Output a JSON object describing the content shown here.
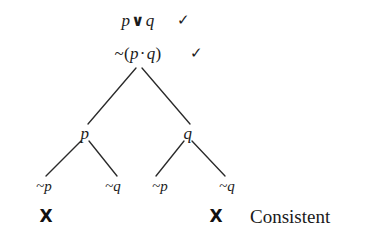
{
  "diagram": {
    "type": "truth-tree",
    "background_color": "#ffffff",
    "ink_color": "#1a1a1a",
    "premises": [
      {
        "id": "premise-1",
        "left_operand": "p",
        "operator": "∨",
        "right_operand": "q",
        "full_text": "p ∨ q",
        "checkmark": "✓",
        "checked": true,
        "x": 138,
        "y": 20
      },
      {
        "id": "premise-2",
        "negation": "~",
        "open_paren": "(",
        "left_operand": "p",
        "operator": "·",
        "right_operand": "q",
        "close_paren": ")",
        "full_text": "~(p · q)",
        "checkmark": "✓",
        "checked": true,
        "x": 138,
        "y": 53
      }
    ],
    "branch_nodes": [
      {
        "id": "branch-node-p",
        "label": "p",
        "x": 85,
        "y": 133
      },
      {
        "id": "branch-node-q",
        "label": "q",
        "x": 188,
        "y": 133
      }
    ],
    "leaves": [
      {
        "id": "leaf-1",
        "negation": "~",
        "atom": "p",
        "label": "~p",
        "x": 44,
        "y": 186,
        "closed": true,
        "close_mark": "X"
      },
      {
        "id": "leaf-2",
        "negation": "~",
        "atom": "q",
        "label": "~q",
        "x": 113,
        "y": 186,
        "closed": false,
        "close_mark": ""
      },
      {
        "id": "leaf-3",
        "negation": "~",
        "atom": "p",
        "label": "~p",
        "x": 160,
        "y": 186,
        "closed": false,
        "close_mark": ""
      },
      {
        "id": "leaf-4",
        "negation": "~",
        "atom": "q",
        "label": "~q",
        "x": 227,
        "y": 186,
        "closed": true,
        "close_mark": "X"
      }
    ],
    "close_marks": [
      {
        "id": "close-mark-1",
        "symbol": "X",
        "x": 46,
        "y": 216
      },
      {
        "id": "close-mark-2",
        "symbol": "X",
        "x": 216,
        "y": 216
      }
    ],
    "verdict": {
      "label": "Consistent",
      "x": 250,
      "y": 216
    },
    "edges": [
      {
        "id": "edge-root-left",
        "x1": 136,
        "y1": 68,
        "x2": 88,
        "y2": 124
      },
      {
        "id": "edge-root-right",
        "x1": 142,
        "y1": 68,
        "x2": 190,
        "y2": 124
      },
      {
        "id": "edge-p-left",
        "x1": 81,
        "y1": 141,
        "x2": 46,
        "y2": 176
      },
      {
        "id": "edge-p-right",
        "x1": 89,
        "y1": 141,
        "x2": 117,
        "y2": 176
      },
      {
        "id": "edge-q-left",
        "x1": 184,
        "y1": 141,
        "x2": 156,
        "y2": 176
      },
      {
        "id": "edge-q-right",
        "x1": 192,
        "y1": 141,
        "x2": 225,
        "y2": 176
      }
    ]
  }
}
